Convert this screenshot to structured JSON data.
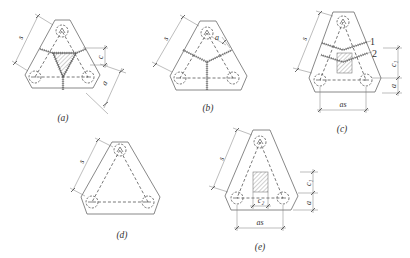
{
  "diagram": {
    "colors": {
      "line": "#555555",
      "edge": "#6a6a6a",
      "background": "#ffffff"
    }
  },
  "figures": [
    {
      "caption": "(a)",
      "dims": {
        "s": "s",
        "c": "c",
        "a": "a"
      }
    },
    {
      "caption": "(b)",
      "dims": {
        "s": "s",
        "a": "a"
      }
    },
    {
      "caption": "(c)",
      "dims": {
        "s": "s",
        "c1": "c₁",
        "a": "a",
        "as": "as"
      },
      "crack_labels": [
        "1",
        "2"
      ]
    },
    {
      "caption": "(d)",
      "dims": {
        "s": "s"
      }
    },
    {
      "caption": "(e)",
      "dims": {
        "s": "s",
        "c1": "c₁",
        "c2": "c₂",
        "a": "a",
        "as": "as"
      }
    }
  ]
}
